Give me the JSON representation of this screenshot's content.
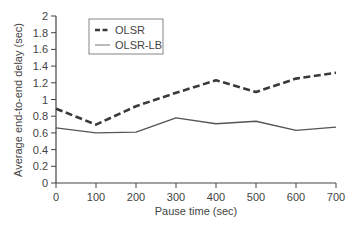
{
  "chart_data": {
    "type": "line",
    "title": "",
    "xlabel": "Pause time (sec)",
    "ylabel": "Average end-to-end delay (sec)",
    "x": [
      0,
      100,
      200,
      300,
      400,
      500,
      600,
      700
    ],
    "xlim": [
      0,
      700
    ],
    "ylim": [
      0,
      2
    ],
    "xticks": [
      "0",
      "100",
      "200",
      "300",
      "400",
      "500",
      "600",
      "700"
    ],
    "yticks": [
      "0",
      "0.2",
      "0.4",
      "0.6",
      "0.8",
      "1",
      "1.2",
      "1.4",
      "1.6",
      "1.8",
      "2"
    ],
    "grid": false,
    "legend_position": "upper left",
    "series": [
      {
        "name": "OLSR",
        "style": "dashed",
        "color": "#3a3a3a",
        "values": [
          0.89,
          0.7,
          0.92,
          1.08,
          1.23,
          1.09,
          1.25,
          1.32
        ]
      },
      {
        "name": "OLSR-LB",
        "style": "solid",
        "color": "#555555",
        "values": [
          0.66,
          0.6,
          0.61,
          0.78,
          0.71,
          0.74,
          0.63,
          0.67
        ]
      }
    ]
  }
}
